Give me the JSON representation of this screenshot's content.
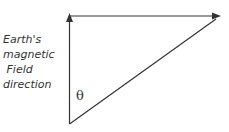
{
  "diagram": {
    "label_lines": [
      "Earth's",
      "magnetic",
      " Field",
      "direction"
    ],
    "angle_symbol": "θ",
    "line_color": "#333333"
  }
}
